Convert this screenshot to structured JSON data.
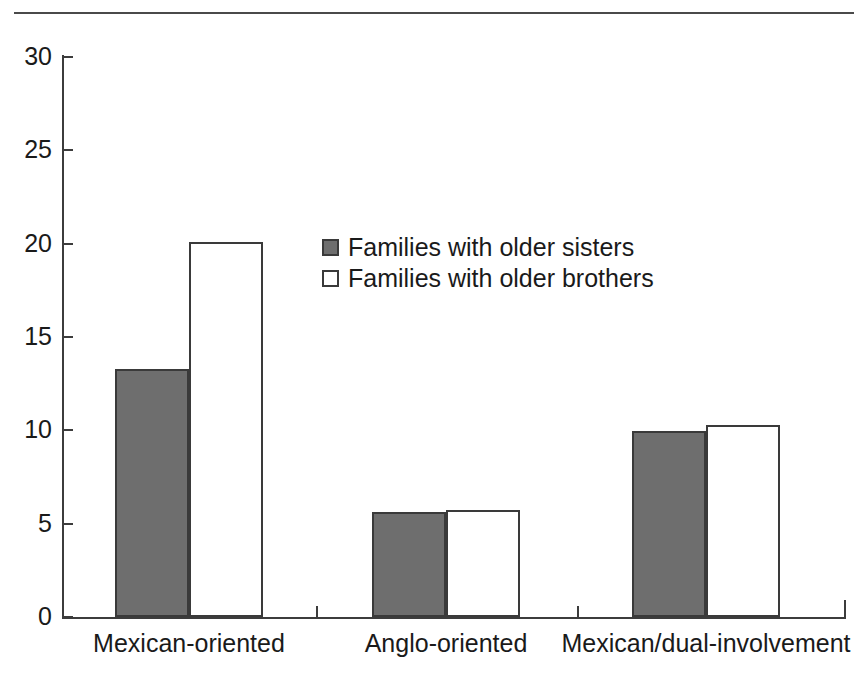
{
  "figure": {
    "has_top_rule": true,
    "background_color": "#ffffff"
  },
  "chart_data": {
    "type": "bar",
    "title": "",
    "subtitle": "",
    "xlabel": "",
    "ylabel": "",
    "categories": [
      "Mexican-oriented",
      "Anglo-oriented",
      "Mexican/dual-involvement"
    ],
    "series": [
      {
        "name": "Families with older sisters",
        "fill": "#6e6e6e",
        "border": "#3a3a3a",
        "values": [
          13.3,
          5.65,
          9.95
        ]
      },
      {
        "name": "Families with older brothers",
        "fill": "#ffffff",
        "border": "#3a3a3a",
        "values": [
          20.1,
          5.75,
          10.3
        ]
      }
    ],
    "ylim": [
      0,
      30
    ],
    "yticks": [
      0,
      5,
      10,
      15,
      20,
      25,
      30
    ],
    "ytick_labels": [
      "0",
      "5",
      "10",
      "15",
      "20",
      "25",
      "30"
    ],
    "grid": false,
    "legend_position": "inside-upper-center"
  },
  "legend": {
    "entries": [
      {
        "label": "Families with older sisters",
        "swatch": "filled-square-swatch"
      },
      {
        "label": "Families with older brothers",
        "swatch": "hollow-square-swatch"
      }
    ]
  }
}
